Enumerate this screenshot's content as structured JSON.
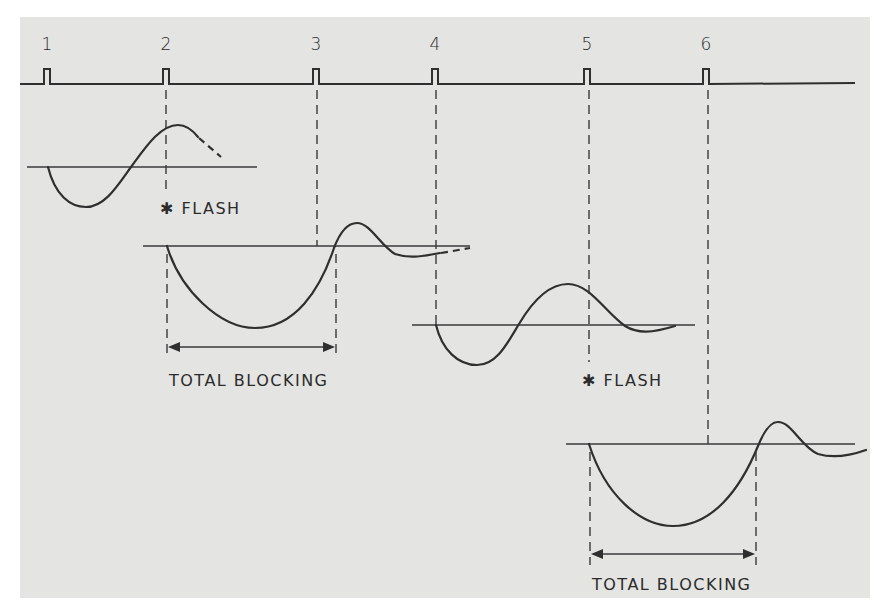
{
  "diagram": {
    "pulse_train": {
      "labels": [
        "1",
        "2",
        "3",
        "4",
        "5",
        "6"
      ],
      "description": "stimulus pulse train"
    },
    "annotations": {
      "flash_1": "✱ FLASH",
      "flash_2": "✱ FLASH",
      "blocking_1": "TOTAL BLOCKING",
      "blocking_2": "TOTAL BLOCKING"
    },
    "traces": [
      {
        "name": "trace-1",
        "note": "response before flash, dashed continuation"
      },
      {
        "name": "trace-2",
        "note": "response after flash at pulse 2, total blocking interval"
      },
      {
        "name": "trace-3",
        "note": "response starting at pulse 4, flash at pulse 5"
      },
      {
        "name": "trace-4",
        "note": "response after flash at pulse 5, total blocking interval"
      }
    ],
    "colors": {
      "background": "#e4e4e2",
      "ink": "#2f2f2f",
      "margin": "#ffffff"
    }
  }
}
